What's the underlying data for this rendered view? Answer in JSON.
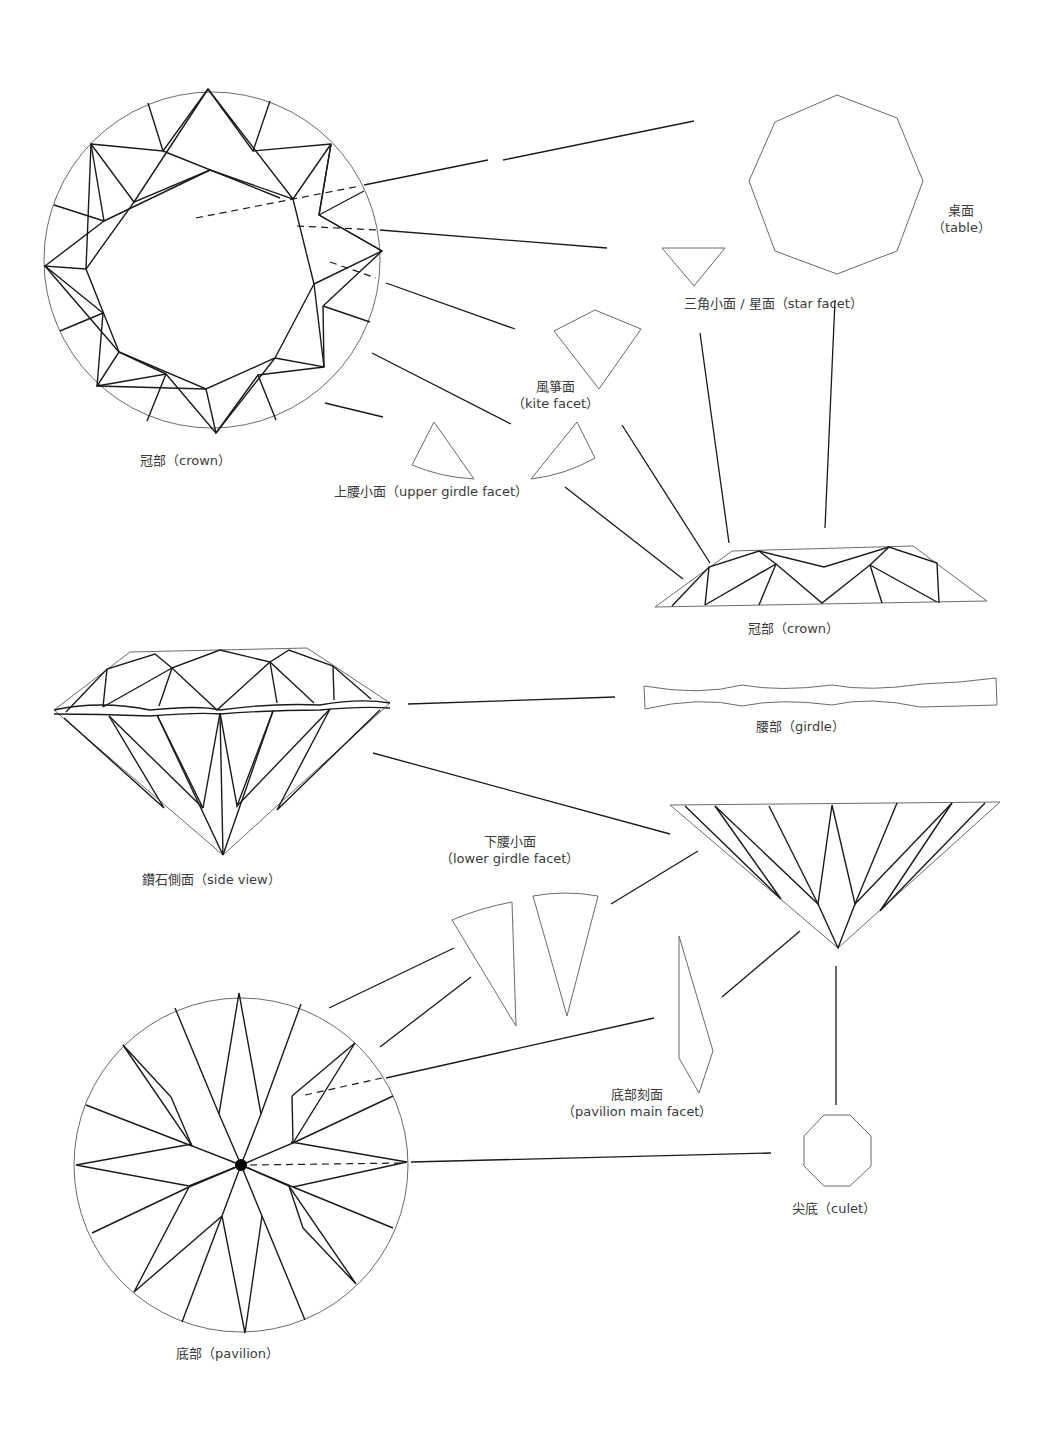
{
  "diagram": {
    "line_color": "#1a1a1a",
    "outline_color": "#6a6a6a",
    "background": "#ffffff"
  },
  "labels": {
    "crown_top": {
      "text": "冠部（crown）"
    },
    "table": {
      "zh": "桌面",
      "en": "（table）"
    },
    "star_facet": {
      "text": "三角小面 / 星面（star facet）"
    },
    "kite_facet": {
      "zh": "風箏面",
      "en": "（kite facet）"
    },
    "upper_girdle_facet": {
      "text": "上腰小面（upper girdle facet）"
    },
    "crown_side": {
      "text": "冠部（crown）"
    },
    "girdle": {
      "text": "腰部（girdle）"
    },
    "side_view": {
      "text": "鑽石側面（side view）"
    },
    "lower_girdle_facet": {
      "zh": "下腰小面",
      "en": "（lower girdle facet）"
    },
    "pavilion_main_facet": {
      "zh": "底部刻面",
      "en": "（pavilion main facet）"
    },
    "culet": {
      "text": "尖底（culet）"
    },
    "pavilion": {
      "text": "底部（pavilion）"
    }
  }
}
